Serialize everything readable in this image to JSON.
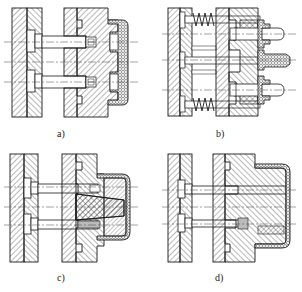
{
  "figure": {
    "subfigures": [
      {
        "id": "a",
        "label": "a)",
        "description": "Ejector pins with screw heads pushing a part through a cover"
      },
      {
        "id": "b",
        "label": "b)",
        "description": "Spring-loaded ejector plate with stripper bushings"
      },
      {
        "id": "c",
        "label": "c)",
        "description": "Ejector pins with tapered core and cover part"
      },
      {
        "id": "d",
        "label": "d)",
        "description": "Ejector pins with stepped core and cover part"
      }
    ]
  },
  "colors": {
    "line": "#1a1a1a",
    "hatch": "#333333",
    "background": "#ffffff",
    "centerline": "#444444"
  }
}
